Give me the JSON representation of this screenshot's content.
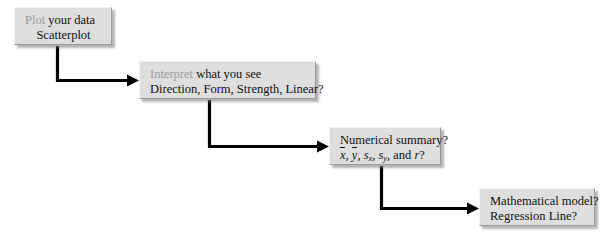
{
  "diagram": {
    "type": "flowchart",
    "orientation": "staircase-left-to-right-descending",
    "background_color": "#ffffff",
    "node_fill_color": "#dedede",
    "node_text_color": "#111111",
    "keyword_text_color": "#9d9d9d",
    "connector_color": "#000000",
    "nodes": [
      {
        "id": "plot",
        "keyword": "Plot",
        "line1_rest": " your data",
        "line2": "Scatterplot"
      },
      {
        "id": "interpret",
        "keyword": "Interpret",
        "line1_rest": " what you see",
        "line2": "Direction, Form, Strength, Linear?"
      },
      {
        "id": "numerical",
        "line1": "Numerical summary?",
        "notation": {
          "xbar": "x",
          "ybar": "y",
          "s": "s",
          "sub_x": "x",
          "sub_y": "y",
          "conjunction": "and",
          "r": "r",
          "terminator": "?",
          "separator": ", "
        }
      },
      {
        "id": "model",
        "line1": "Mathematical model?",
        "line2": "Regression Line?"
      }
    ],
    "connectors": [
      {
        "id": "plot-to-interpret",
        "from": "plot",
        "to": "interpret",
        "style": "elbow-down-right",
        "arrowhead": "solid-triangle"
      },
      {
        "id": "interpret-to-numerical",
        "from": "interpret",
        "to": "numerical",
        "style": "elbow-down-right",
        "arrowhead": "solid-triangle"
      },
      {
        "id": "numerical-to-model",
        "from": "numerical",
        "to": "model",
        "style": "elbow-down-right",
        "arrowhead": "solid-triangle"
      }
    ]
  }
}
